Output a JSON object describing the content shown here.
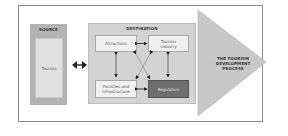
{
  "diagram": {
    "source": {
      "title": "SOURCE",
      "node": "Tourists"
    },
    "destination": {
      "title": "DESTINATION",
      "nodes": [
        {
          "label": "Attractions",
          "style": "light"
        },
        {
          "label": "Tourism industry",
          "style": "light"
        },
        {
          "label": "Facilities and infrastructure",
          "style": "light"
        },
        {
          "label": "Regulators",
          "style": "dark"
        }
      ]
    },
    "process_arrow": {
      "lines": [
        "THE TOURISM",
        "DEVELOPMENT",
        "PROCESS"
      ]
    },
    "connections": [
      {
        "from": "Tourists",
        "to": "Destination",
        "type": "bidirectional"
      },
      {
        "from": "Attractions",
        "to": "Tourism industry",
        "type": "bidirectional"
      },
      {
        "from": "Attractions",
        "to": "Facilities and infrastructure",
        "type": "bidirectional"
      },
      {
        "from": "Tourism industry",
        "to": "Regulators",
        "type": "bidirectional"
      },
      {
        "from": "Facilities and infrastructure",
        "to": "Regulators",
        "type": "bidirectional"
      },
      {
        "from": "Attractions",
        "to": "Regulators",
        "type": "bidirectional-diagonal"
      },
      {
        "from": "Tourism industry",
        "to": "Facilities and infrastructure",
        "type": "bidirectional-diagonal"
      }
    ],
    "colors": {
      "source_fill": "#b3b3b3",
      "destination_fill": "#d3d3d3",
      "node_fill": "#f0f0f0",
      "regulators_fill": "#6d6d6d",
      "arrow_fill": "#c8c8c8",
      "frame_border": "#8c8c8c"
    }
  }
}
